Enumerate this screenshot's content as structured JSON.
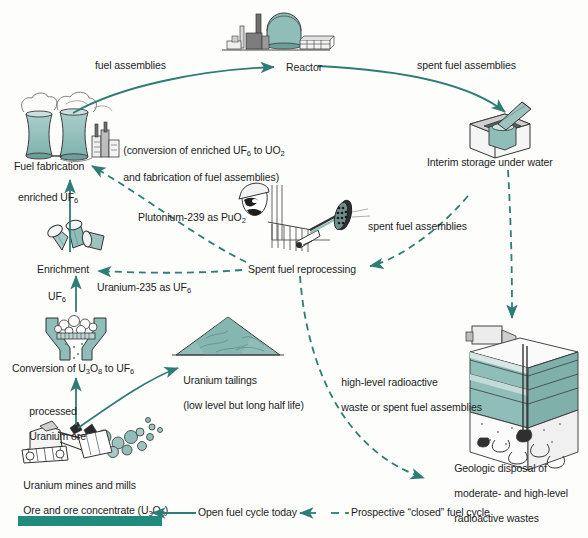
{
  "diagram": {
    "accent_color": "#2e7d74",
    "illustration_fill": "#8fbdb8",
    "text_color": "#1c1c1c",
    "background": "#fdfdfc"
  },
  "nodes": [
    {
      "id": "reactor",
      "label": "Reactor",
      "x": 286,
      "y": 61
    },
    {
      "id": "fuel-fabrication",
      "label": "Fuel fabrication",
      "x": 14,
      "y": 160
    },
    {
      "id": "fuel-fabrication-note",
      "label_line1": "(conversion of enriched UF6 to UO2",
      "label_line2": "and fabrication of fuel assemblies)",
      "x": 112,
      "y": 131
    },
    {
      "id": "interim-storage",
      "label": "Interim storage under water",
      "x": 427,
      "y": 156
    },
    {
      "id": "enrichment",
      "label": "Enrichment",
      "x": 37,
      "y": 263
    },
    {
      "id": "conversion",
      "label": "Conversion of U3O8 to UF6",
      "x": 12,
      "y": 362
    },
    {
      "id": "uranium-tailings",
      "label_line1": "Uranium tailings",
      "label_line2": "(low level but long half life)",
      "x": 172,
      "y": 361
    },
    {
      "id": "uranium-mines",
      "label_line1": "Uranium mines and mills",
      "label_line2": "Ore and ore concentrate (U3O8)",
      "x": 12,
      "y": 466
    },
    {
      "id": "spent-fuel-reprocessing",
      "label": "Spent fuel reprocessing",
      "x": 248,
      "y": 263
    },
    {
      "id": "geologic-disposal",
      "label_line1": "Geologic disposal of",
      "label_line2": "moderate- and high-level",
      "label_line3": "radioactive wastes",
      "x": 443,
      "y": 449
    }
  ],
  "flow_labels": [
    {
      "id": "fuel-assemblies-to-reactor",
      "text": "fuel assemblies",
      "x": 95,
      "y": 59
    },
    {
      "id": "spent-fuel-to-storage",
      "text": "spent fuel assemblies",
      "x": 417,
      "y": 59
    },
    {
      "id": "enriched-uf6",
      "text": "enriched UF6",
      "x": 18,
      "y": 191
    },
    {
      "id": "uf6",
      "text": "UF6",
      "x": 48,
      "y": 290
    },
    {
      "id": "processed-uranium-ore",
      "text_line1": "processed",
      "text_line2": "Uranium ore",
      "x": 18,
      "y": 392
    },
    {
      "id": "plutonium-239",
      "text": "Plutonium-239 as PuO2",
      "x": 138,
      "y": 211
    },
    {
      "id": "uranium-235",
      "text": "Uranium-235 as UF6",
      "x": 97,
      "y": 281
    },
    {
      "id": "spent-fuel-to-reprocessing",
      "text": "spent fuel assemblies",
      "x": 368,
      "y": 220
    },
    {
      "id": "high-level-waste",
      "text_line1": "high-level radioactive",
      "text_line2": "waste or spent fuel assemblies",
      "x": 330,
      "y": 363
    }
  ],
  "legend": {
    "open_cycle": "Open fuel cycle today",
    "closed_cycle": "Prospective “closed” fuel cycle"
  }
}
